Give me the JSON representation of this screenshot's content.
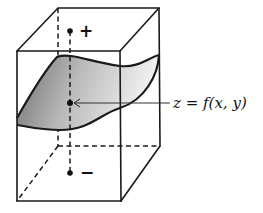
{
  "diagram": {
    "type": "3d-box-with-surface",
    "surface_label": "z = f(x, y)",
    "positive_label": "+",
    "negative_label": "−",
    "colors": {
      "line": "#1a1a1a",
      "surface_dark": "#7a7a7a",
      "surface_light": "#f2f2f2",
      "background": "#ffffff"
    },
    "elements": [
      "rectangular box (wireframe, hidden edges dashed)",
      "curved surface patch spanning the box",
      "vertical dashed axis through surface point",
      "positive normal point above surface",
      "negative normal point below surface",
      "leader line to surface label"
    ]
  }
}
